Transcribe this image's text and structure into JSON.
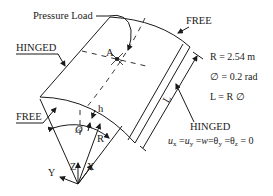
{
  "diagram": {
    "type": "cylindrical-shell-panel",
    "labels": {
      "pressure_load": "Pressure Load",
      "free_top": "FREE",
      "free_left": "FREE",
      "hinged_left": "HINGED",
      "hinged_bottom": "HINGED",
      "point_a": "A",
      "length": "L",
      "thickness": "h",
      "angle": "Ø",
      "radius": "R"
    },
    "parameters": [
      {
        "text": "R = 2.54 m"
      },
      {
        "text": "∅ = 0.2 rad"
      },
      {
        "text": "L = R ∅"
      }
    ],
    "boundary_condition": {
      "ux": "u",
      "ux_sub": "x",
      "eq1": " =",
      "uy": "u",
      "uy_sub": "y",
      "eq2": " =",
      "w": "w",
      "eq3": "=",
      "thy": "θ",
      "thy_sub": "y",
      "eq4": " =",
      "thz": "θ",
      "thz_sub": "z",
      "eq5": " = 0"
    },
    "axes": {
      "x": "X",
      "y": "Y",
      "z": "Z"
    }
  }
}
